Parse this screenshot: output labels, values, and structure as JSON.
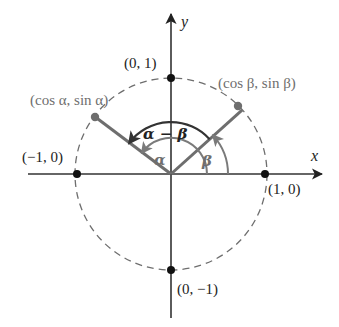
{
  "diagram": {
    "axes": {
      "x_label": "x",
      "y_label": "y"
    },
    "points": {
      "top": "(0, 1)",
      "bottom": "(0, −1)",
      "left": "(−1, 0)",
      "right": "(1, 0)",
      "alpha_point": "(cos α, sin α)",
      "beta_point": "(cos β, sin β)"
    },
    "angle_labels": {
      "alpha": "α",
      "beta": "β",
      "alpha_minus_beta": "α − β"
    },
    "colors": {
      "axis": "#333333",
      "ray": "#6e6e6e",
      "circle": "#6e6e6e",
      "arc_dark": "#333333",
      "arc_gray": "#7a7a7a",
      "point_black": "#111111",
      "point_gray": "#6e6e6e"
    },
    "geometry": {
      "center": [
        171,
        174
      ],
      "radius_px": 96,
      "alpha_deg": 143,
      "beta_deg": 42
    }
  }
}
